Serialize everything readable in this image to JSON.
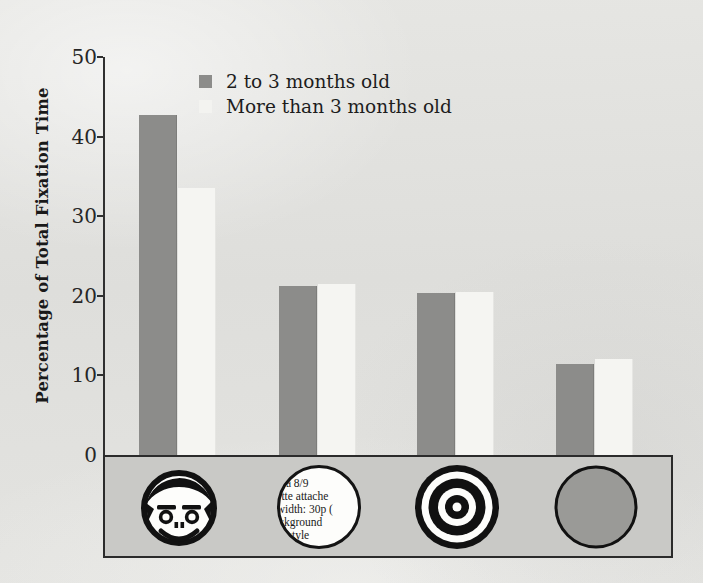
{
  "chart_data": {
    "type": "bar",
    "title": "",
    "xlabel": "",
    "ylabel": "Percentage of Total Fixation Time",
    "ylim": [
      0,
      50
    ],
    "yticks": [
      0,
      10,
      20,
      30,
      40,
      50
    ],
    "ytick_labels": [
      "0",
      "10",
      "20",
      "30",
      "40",
      "50"
    ],
    "grid": false,
    "legend_position": "upper center",
    "categories": [
      "face",
      "text",
      "bullseye",
      "plain-disk"
    ],
    "category_icons": [
      "schematic-face-icon",
      "newsprint-text-circle-icon",
      "bullseye-icon",
      "plain-gray-disk-icon"
    ],
    "series": [
      {
        "name": "2 to 3 months old",
        "color": "#8c8c8a",
        "values": [
          42.7,
          21.2,
          20.4,
          11.4
        ]
      },
      {
        "name": "More than 3 months old",
        "color": "#f5f5f2",
        "values": [
          33.6,
          21.5,
          20.5,
          12.1
        ]
      }
    ]
  },
  "axis": {
    "y_title": "Percentage of Total Fixation Time",
    "y_ticks": [
      {
        "label": "50",
        "value": 50
      },
      {
        "label": "40",
        "value": 40
      },
      {
        "label": "30",
        "value": 30
      },
      {
        "label": "20",
        "value": 20
      },
      {
        "label": "10",
        "value": 10
      },
      {
        "label": "0",
        "value": 0
      }
    ]
  },
  "legend": {
    "entries": [
      {
        "label": "2 to 3 months old",
        "swatch": "series-a"
      },
      {
        "label": "More than 3 months old",
        "swatch": "series-b"
      }
    ]
  },
  "stimuli": [
    {
      "name": "schematic-face-icon",
      "kind": "face"
    },
    {
      "name": "newsprint-text-circle-icon",
      "kind": "text",
      "lines": [
        "mma 8/9",
        "alette attache",
        "n width: 30p (",
        "background",
        "ical style"
      ]
    },
    {
      "name": "bullseye-icon",
      "kind": "bullseye"
    },
    {
      "name": "plain-gray-disk-icon",
      "kind": "disk"
    }
  ],
  "colors": {
    "series_a": "#8c8c8a",
    "series_b": "#f5f5f2",
    "axis": "#2b2b2b",
    "strip_background": "#c9c9c6",
    "page_background": "#e3e3e0"
  }
}
